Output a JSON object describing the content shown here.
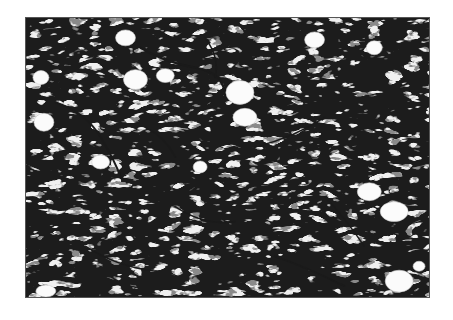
{
  "image": {
    "description": "Grayscale histology micrograph of fibrous tissue with dark stained fibers and scattered clear vacuoles",
    "colors": {
      "background": "#ffffff",
      "tissue_light": "#f2f2f2",
      "fiber_dark": "#1a1a1a",
      "fiber_mid": "#6e6e6e"
    }
  }
}
